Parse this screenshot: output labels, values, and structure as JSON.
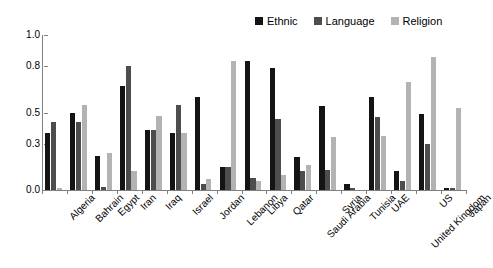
{
  "chart_data": {
    "type": "bar",
    "title": "",
    "subtitle": "",
    "xlabel": "",
    "ylabel": "",
    "ylim": [
      0.0,
      1.0
    ],
    "yticks": [
      "0.0",
      "0.3",
      "0.5",
      "0.8",
      "1.0"
    ],
    "ytick_values": [
      0.0,
      0.3,
      0.5,
      0.8,
      1.0
    ],
    "grid": false,
    "legend_position": "top-right",
    "categories": [
      "Algeria",
      "Bahrain",
      "Egypt",
      "Iran",
      "Iraq",
      "Israel",
      "Jordan",
      "Lebanon",
      "Libya",
      "Qatar",
      "Saudi Arabia",
      "Syria",
      "Tunisia",
      "UAE",
      "United Kingdom",
      "US",
      "Japan"
    ],
    "series": [
      {
        "name": "Ethnic",
        "color": "#141414",
        "values": [
          0.37,
          0.5,
          0.22,
          0.67,
          0.39,
          0.37,
          0.6,
          0.15,
          0.83,
          0.79,
          0.21,
          0.54,
          0.04,
          0.6,
          0.12,
          0.49,
          0.01
        ]
      },
      {
        "name": "Language",
        "color": "#4d4d4d",
        "values": [
          0.44,
          0.44,
          0.02,
          0.8,
          0.39,
          0.55,
          0.04,
          0.15,
          0.08,
          0.46,
          0.12,
          0.13,
          0.01,
          0.47,
          0.06,
          0.3,
          0.01
        ]
      },
      {
        "name": "Religion",
        "color": "#b3b3b3",
        "values": [
          0.01,
          0.55,
          0.24,
          0.12,
          0.48,
          0.37,
          0.07,
          0.83,
          0.06,
          0.1,
          0.16,
          0.34,
          0.0,
          0.35,
          0.7,
          0.86,
          0.53
        ]
      }
    ]
  }
}
